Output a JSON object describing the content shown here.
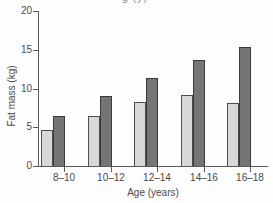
{
  "figure": {
    "cropped_title_fragment": "g (y)",
    "background": "#fdfdfd"
  },
  "chart_data": {
    "type": "bar",
    "title": "",
    "categories": [
      "8–10",
      "10–12",
      "12–14",
      "14–16",
      "16–18"
    ],
    "series": [
      {
        "name": "light-gray-bars",
        "color": "#d8d8d8",
        "border": "#4d4d4d",
        "values": [
          4.7,
          6.5,
          8.2,
          9.2,
          8.1
        ]
      },
      {
        "name": "dark-gray-bars",
        "color": "#757575",
        "border": "#3a3a3a",
        "values": [
          6.5,
          9.0,
          11.3,
          13.7,
          15.3
        ]
      }
    ],
    "xlabel": "Age (years)",
    "ylabel": "Fat mass (kg)",
    "ylim": [
      0,
      20
    ],
    "yticks": [
      0,
      5,
      10,
      15,
      20
    ],
    "grid": false,
    "legend": "none",
    "axis_color": "#5a5a5a",
    "text_color": "#4a4a4a"
  }
}
